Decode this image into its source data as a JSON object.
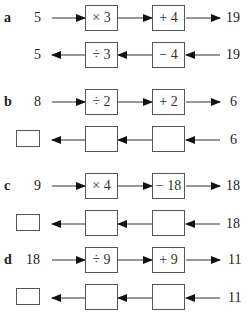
{
  "problems": [
    {
      "label": "a",
      "forward": {
        "input": "5",
        "op1": "× 3",
        "op2": "+ 4",
        "output": "19"
      },
      "inverse": {
        "input": "19",
        "op1": "− 4",
        "op2": "÷ 3",
        "output": "5",
        "answer_box": false
      }
    },
    {
      "label": "b",
      "forward": {
        "input": "8",
        "op1": "÷ 2",
        "op2": "+ 2",
        "output": "6"
      },
      "inverse": {
        "input": "6",
        "op1": "",
        "op2": "",
        "output": "",
        "answer_box": true
      }
    },
    {
      "label": "c",
      "forward": {
        "input": "9",
        "op1": "× 4",
        "op2": "− 18",
        "output": "18"
      },
      "inverse": {
        "input": "18",
        "op1": "",
        "op2": "",
        "output": "",
        "answer_box": true
      }
    },
    {
      "label": "d",
      "forward": {
        "input": "18",
        "op1": "÷ 9",
        "op2": "+ 9",
        "output": "11"
      },
      "inverse": {
        "input": "11",
        "op1": "",
        "op2": "",
        "output": "",
        "answer_box": true
      }
    }
  ],
  "colors": {
    "line": "#222222",
    "box_border": "#555555",
    "text": "#222222"
  }
}
